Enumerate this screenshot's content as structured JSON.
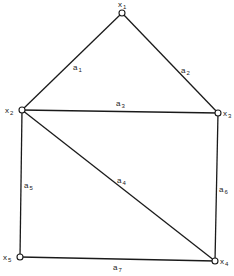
{
  "graph": {
    "nodes": [
      {
        "id": "x1",
        "name": "x",
        "sub": "1",
        "x": 122,
        "y": 13,
        "lx": 118,
        "ly": 7
      },
      {
        "id": "x2",
        "name": "x",
        "sub": "2",
        "x": 22,
        "y": 110,
        "lx": 5,
        "ly": 113
      },
      {
        "id": "x3",
        "name": "x",
        "sub": "3",
        "x": 218,
        "y": 113,
        "lx": 223,
        "ly": 116
      },
      {
        "id": "x4",
        "name": "x",
        "sub": "4",
        "x": 215,
        "y": 261,
        "lx": 220,
        "ly": 264
      },
      {
        "id": "x5",
        "name": "x",
        "sub": "5",
        "x": 20,
        "y": 257,
        "lx": 3,
        "ly": 260
      }
    ],
    "edges": [
      {
        "id": "a1",
        "name": "a",
        "sub": "1",
        "from": "x1",
        "to": "x2",
        "lx": 73,
        "ly": 70
      },
      {
        "id": "a2",
        "name": "a",
        "sub": "2",
        "from": "x1",
        "to": "x3",
        "lx": 181,
        "ly": 73
      },
      {
        "id": "a3",
        "name": "a",
        "sub": "3",
        "from": "x2",
        "to": "x3",
        "lx": 116,
        "ly": 106
      },
      {
        "id": "a4",
        "name": "a",
        "sub": "4",
        "from": "x2",
        "to": "x4",
        "lx": 117,
        "ly": 183
      },
      {
        "id": "a5",
        "name": "a",
        "sub": "5",
        "from": "x2",
        "to": "x5",
        "lx": 24,
        "ly": 188
      },
      {
        "id": "a6",
        "name": "a",
        "sub": "6",
        "from": "x3",
        "to": "x4",
        "lx": 219,
        "ly": 192
      },
      {
        "id": "a7",
        "name": "a",
        "sub": "7",
        "from": "x5",
        "to": "x4",
        "lx": 113,
        "ly": 270
      }
    ]
  }
}
